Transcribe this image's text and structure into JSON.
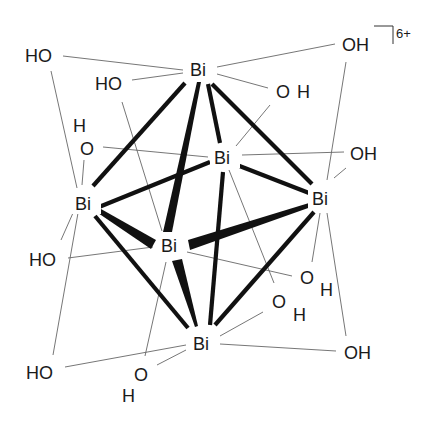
{
  "diagram": {
    "charge": "6+",
    "bismuth_atoms": [
      {
        "id": "bi_top",
        "label": "Bi"
      },
      {
        "id": "bi_back",
        "label": "Bi"
      },
      {
        "id": "bi_left",
        "label": "Bi"
      },
      {
        "id": "bi_right",
        "label": "Bi"
      },
      {
        "id": "bi_front",
        "label": "Bi"
      },
      {
        "id": "bi_bottom",
        "label": "Bi"
      }
    ],
    "hydroxyl_labels": [
      {
        "id": "oh_top_left",
        "text": "HO"
      },
      {
        "id": "oh_top_inner_left",
        "text": "HO"
      },
      {
        "id": "oh_top_right",
        "text": "OH"
      },
      {
        "id": "oh_top_inner_right_o",
        "text": "O"
      },
      {
        "id": "oh_top_inner_right_h",
        "text": "H"
      },
      {
        "id": "oh_back_left_h",
        "text": "H"
      },
      {
        "id": "oh_back_left_o",
        "text": "O"
      },
      {
        "id": "oh_right",
        "text": "OH"
      },
      {
        "id": "oh_left_mid",
        "text": "HO"
      },
      {
        "id": "oh_lower_right1_o",
        "text": "O"
      },
      {
        "id": "oh_lower_right1_h",
        "text": "H"
      },
      {
        "id": "oh_lower_right2_o",
        "text": "O"
      },
      {
        "id": "oh_lower_right2_h",
        "text": "H"
      },
      {
        "id": "oh_bottom_left",
        "text": "HO"
      },
      {
        "id": "oh_bottom_center_o",
        "text": "O"
      },
      {
        "id": "oh_bottom_center_h",
        "text": "H"
      },
      {
        "id": "oh_bottom_right",
        "text": "OH"
      }
    ],
    "colors": {
      "bond": "#111111",
      "thin_bond": "#666666",
      "text": "#1a1a1a",
      "background": "#ffffff"
    }
  }
}
